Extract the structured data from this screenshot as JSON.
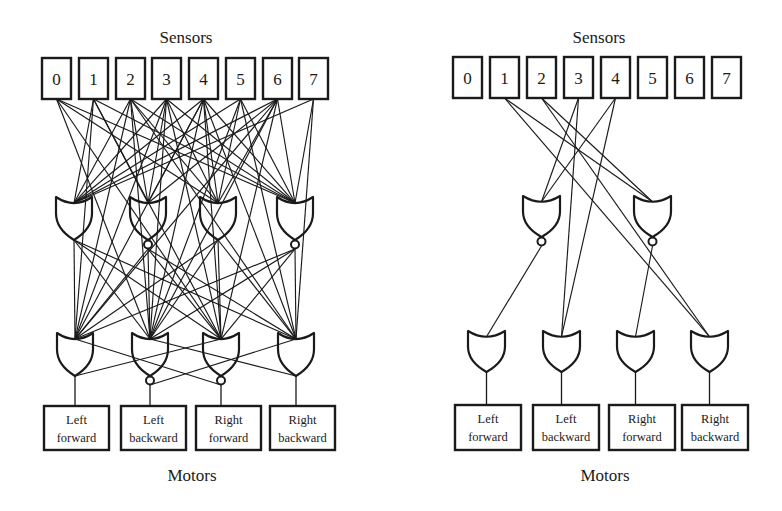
{
  "panels": [
    {
      "id": "left",
      "title": "Sensors",
      "footer": "Motors",
      "sensors": [
        "0",
        "1",
        "2",
        "3",
        "4",
        "5",
        "6",
        "7"
      ],
      "hidden_gates": [
        {
          "type": "OR"
        },
        {
          "type": "NOR"
        },
        {
          "type": "OR"
        },
        {
          "type": "NOR"
        }
      ],
      "output_gates": [
        {
          "type": "OR"
        },
        {
          "type": "NOR"
        },
        {
          "type": "NOR"
        },
        {
          "type": "OR"
        }
      ],
      "motors": [
        {
          "line1": "Left",
          "line2": "forward"
        },
        {
          "line1": "Left",
          "line2": "backward"
        },
        {
          "line1": "Right",
          "line2": "forward"
        },
        {
          "line1": "Right",
          "line2": "backward"
        }
      ],
      "sensor_to_hidden": [
        [
          0,
          2
        ],
        [
          0,
          3
        ],
        [
          1,
          0
        ],
        [
          1,
          1
        ],
        [
          1,
          3
        ],
        [
          2,
          0
        ],
        [
          2,
          1
        ],
        [
          2,
          2
        ],
        [
          2,
          3
        ],
        [
          3,
          0
        ],
        [
          3,
          1
        ],
        [
          3,
          2
        ],
        [
          3,
          3
        ],
        [
          4,
          0
        ],
        [
          4,
          1
        ],
        [
          4,
          2
        ],
        [
          4,
          3
        ],
        [
          5,
          0
        ],
        [
          5,
          2
        ],
        [
          5,
          3
        ],
        [
          6,
          0
        ],
        [
          6,
          1
        ],
        [
          6,
          2
        ],
        [
          6,
          3
        ],
        [
          7,
          0
        ],
        [
          7,
          3
        ]
      ],
      "sensor_to_output": [
        [
          0,
          1
        ],
        [
          0,
          2
        ],
        [
          1,
          0
        ],
        [
          1,
          2
        ],
        [
          2,
          0
        ],
        [
          2,
          1
        ],
        [
          2,
          3
        ],
        [
          3,
          0
        ],
        [
          3,
          1
        ],
        [
          3,
          2
        ],
        [
          4,
          0
        ],
        [
          4,
          1
        ],
        [
          4,
          2
        ],
        [
          4,
          3
        ],
        [
          5,
          1
        ],
        [
          5,
          3
        ],
        [
          6,
          0
        ],
        [
          6,
          1
        ],
        [
          6,
          2
        ],
        [
          7,
          3
        ]
      ],
      "hidden_to_output": [
        [
          0,
          0
        ],
        [
          0,
          1
        ],
        [
          0,
          2
        ],
        [
          0,
          3
        ],
        [
          1,
          0
        ],
        [
          1,
          1
        ],
        [
          1,
          2
        ],
        [
          1,
          3
        ],
        [
          2,
          0
        ],
        [
          2,
          1
        ],
        [
          2,
          2
        ],
        [
          2,
          3
        ],
        [
          3,
          0
        ],
        [
          3,
          1
        ],
        [
          3,
          2
        ],
        [
          3,
          3
        ]
      ],
      "output_to_output": [
        [
          0,
          2
        ],
        [
          1,
          3
        ],
        [
          2,
          0
        ],
        [
          3,
          1
        ]
      ]
    },
    {
      "id": "right",
      "title": "Sensors",
      "footer": "Motors",
      "sensors": [
        "0",
        "1",
        "2",
        "3",
        "4",
        "5",
        "6",
        "7"
      ],
      "hidden_gates": [
        {
          "type": "NOR"
        },
        {
          "type": "NOR"
        }
      ],
      "output_gates": [
        {
          "type": "OR"
        },
        {
          "type": "OR"
        },
        {
          "type": "OR"
        },
        {
          "type": "OR"
        }
      ],
      "motors": [
        {
          "line1": "Left",
          "line2": "forward"
        },
        {
          "line1": "Left",
          "line2": "backward"
        },
        {
          "line1": "Right",
          "line2": "forward"
        },
        {
          "line1": "Right",
          "line2": "backward"
        }
      ],
      "sensor_to_hidden": [
        [
          1,
          1
        ],
        [
          2,
          1
        ],
        [
          3,
          0
        ],
        [
          4,
          0
        ]
      ],
      "sensor_to_output": [
        [
          1,
          3
        ],
        [
          2,
          3
        ],
        [
          3,
          1
        ],
        [
          4,
          1
        ]
      ],
      "hidden_to_output": [
        [
          0,
          0
        ],
        [
          1,
          2
        ]
      ],
      "output_to_output": []
    }
  ]
}
